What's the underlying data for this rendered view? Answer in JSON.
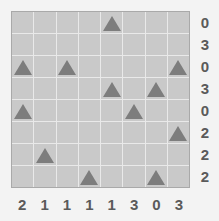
{
  "puzzle": {
    "title": "triangle-grid-puzzle",
    "grid": {
      "rows": 8,
      "cols": 8,
      "cell_background": "#c9c9c9",
      "gridline_color": "#e9e9e9",
      "border_color": "#a9a9a9",
      "marker_icon": "triangle-icon",
      "marker_color": "#7d7d7d"
    },
    "row_labels": [
      "0",
      "3",
      "0",
      "3",
      "0",
      "2",
      "2",
      "2"
    ],
    "col_labels": [
      "2",
      "1",
      "1",
      "1",
      "1",
      "3",
      "0",
      "3"
    ],
    "cells": [
      [
        false,
        false,
        false,
        false,
        true,
        false,
        false,
        false
      ],
      [
        false,
        false,
        false,
        false,
        false,
        false,
        false,
        false
      ],
      [
        true,
        false,
        true,
        false,
        false,
        false,
        false,
        true
      ],
      [
        false,
        false,
        false,
        false,
        true,
        false,
        true,
        false
      ],
      [
        true,
        false,
        false,
        false,
        false,
        true,
        false,
        false
      ],
      [
        false,
        false,
        false,
        false,
        false,
        false,
        false,
        true
      ],
      [
        false,
        true,
        false,
        false,
        false,
        false,
        false,
        false
      ],
      [
        false,
        false,
        false,
        true,
        false,
        false,
        true,
        false
      ]
    ]
  }
}
